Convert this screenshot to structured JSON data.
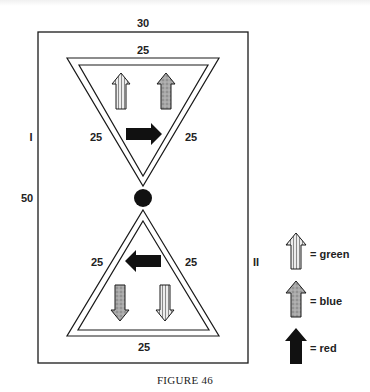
{
  "figure": {
    "caption": "FIGURE 46",
    "labels": {
      "outer_top": "30",
      "outer_left_height": "50",
      "region_top": "I",
      "region_bottom": "II",
      "top_triangle": {
        "top": "25",
        "left": "25",
        "right": "25"
      },
      "bottom_triangle": {
        "bottom": "25",
        "left": "25",
        "right": "25"
      }
    },
    "top_triangle_arrows": [
      {
        "direction": "up",
        "color": "green",
        "fill": "striped"
      },
      {
        "direction": "up",
        "color": "blue",
        "fill": "stippled"
      },
      {
        "direction": "right",
        "color": "red",
        "fill": "solid"
      }
    ],
    "bottom_triangle_arrows": [
      {
        "direction": "left",
        "color": "red",
        "fill": "solid"
      },
      {
        "direction": "down",
        "color": "blue",
        "fill": "stippled"
      },
      {
        "direction": "down",
        "color": "green",
        "fill": "striped"
      }
    ],
    "connector": "black-circle"
  },
  "legend": {
    "items": [
      {
        "symbol": "striped-arrow",
        "label": "= green"
      },
      {
        "symbol": "stippled-arrow",
        "label": "= blue"
      },
      {
        "symbol": "solid-arrow",
        "label": "= red"
      }
    ]
  },
  "colors": {
    "ink": "#1a1a1a",
    "stripe_light": "#e8e8e8",
    "stripe_dark": "#8a8a8a",
    "stipple": "#9a9a9a"
  }
}
